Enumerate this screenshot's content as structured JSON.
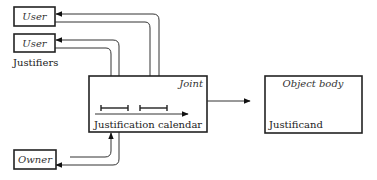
{
  "diagram": {
    "justifiers": {
      "group_label": "Justifiers",
      "users": [
        {
          "label": "User"
        },
        {
          "label": "User"
        }
      ]
    },
    "owner": {
      "label": "Owner"
    },
    "joint": {
      "title": "Joint",
      "caption": "Justification calendar"
    },
    "object": {
      "title": "Object body",
      "caption": "Justificand"
    }
  }
}
